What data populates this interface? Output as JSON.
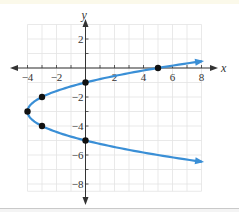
{
  "chart_data": {
    "type": "line",
    "title": "",
    "xlabel": "x",
    "ylabel": "y",
    "xlim": [
      -4,
      8
    ],
    "ylim": [
      -8.5,
      3
    ],
    "grid": true,
    "equation": "x = (y + 3)^2 - 4",
    "x_ticks": [
      -4,
      -2,
      2,
      4,
      6,
      8
    ],
    "x_tick_labels": [
      "−4",
      "−2",
      "2",
      "4",
      "6",
      "8"
    ],
    "y_ticks": [
      2,
      -2,
      -4,
      -6,
      -8
    ],
    "y_tick_labels": [
      "2",
      "−2",
      "−4",
      "−6",
      "−8"
    ],
    "series": [
      {
        "name": "parabola",
        "color": "#3a8fd6",
        "points": [
          {
            "x": 5,
            "y": 0
          },
          {
            "x": 0,
            "y": -1
          },
          {
            "x": -3,
            "y": -2
          },
          {
            "x": -4,
            "y": -3
          },
          {
            "x": -3,
            "y": -4
          },
          {
            "x": 0,
            "y": -5
          }
        ],
        "end_arrows": [
          {
            "x": 8,
            "y": 0.46
          },
          {
            "x": 8,
            "y": -6.46
          }
        ]
      }
    ],
    "colors": {
      "curve": "#3a8fd6",
      "axis": "#333333",
      "grid": "#e3e3e3",
      "point": "#111111"
    }
  }
}
